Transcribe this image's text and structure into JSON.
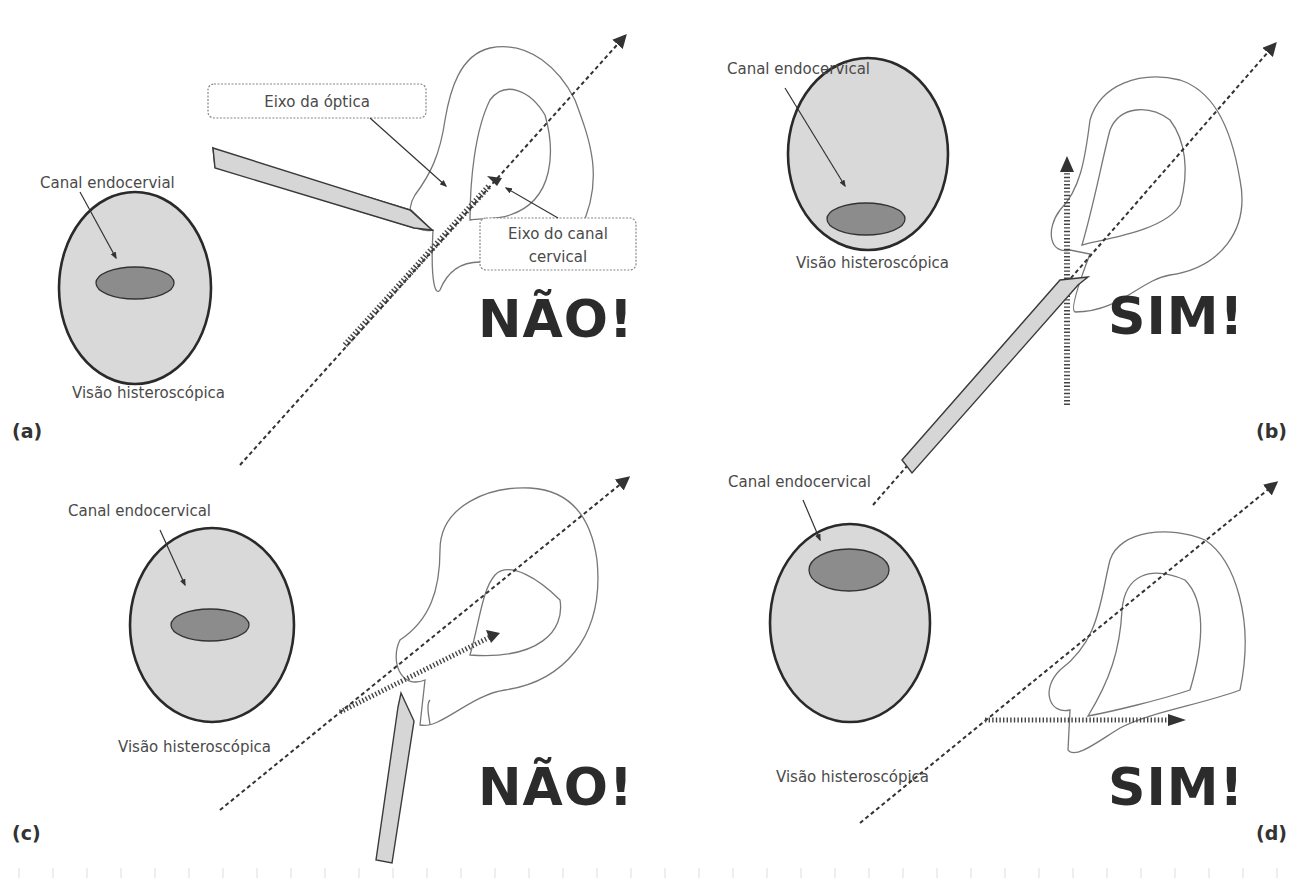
{
  "figure": {
    "panels": [
      {
        "id": "a",
        "letter": "(a)",
        "verdict": "NÃO!",
        "canal_label": "Canal endocervial",
        "view_label": "Visão histeroscópica",
        "callouts": {
          "optic_axis": "Eixo da óptica",
          "cervical_axis_line1": "Eixo do canal",
          "cervical_axis_line2": "cervical"
        },
        "canal_position": "center"
      },
      {
        "id": "b",
        "letter": "(b)",
        "verdict": "SIM!",
        "canal_label": "Canal endocervical",
        "view_label": "Visão histeroscópica",
        "canal_position": "bottom"
      },
      {
        "id": "c",
        "letter": "(c)",
        "verdict": "NÃO!",
        "canal_label": "Canal endocervical",
        "view_label": "Visão histeroscópica",
        "canal_position": "center"
      },
      {
        "id": "d",
        "letter": "(d)",
        "verdict": "SIM!",
        "canal_label": "Canal endocervical",
        "view_label": "Visão histeroscópica",
        "canal_position": "top"
      }
    ],
    "colors": {
      "circle_fill": "#d9d9d9",
      "canal_fill": "#8c8c8c",
      "scope_fill": "#d6d6d6",
      "text": "#4a4a4a",
      "verdict": "#2b2b2b"
    }
  }
}
